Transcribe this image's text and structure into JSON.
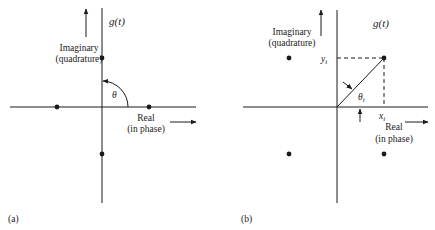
{
  "figure": {
    "panel_a": {
      "caption": "(a)",
      "title": "g(t)",
      "imaginary_label_line1": "Imaginary",
      "imaginary_label_line2": "(quadrature)",
      "real_label_line1": "Real",
      "real_label_line2": "(in phase)",
      "angle_label": "θ",
      "points": [
        {
          "name": "top",
          "x": 0,
          "y": 1
        },
        {
          "name": "left",
          "x": -1,
          "y": 0
        },
        {
          "name": "right",
          "x": 1,
          "y": 0
        },
        {
          "name": "bottom",
          "x": 0,
          "y": -1
        }
      ]
    },
    "panel_b": {
      "caption": "(b)",
      "title": "g(t)",
      "imaginary_label_line1": "Imaginary",
      "imaginary_label_line2": "(quadrature)",
      "real_label_line1": "Real",
      "real_label_line2": "(in phase)",
      "angle_label": "θ",
      "angle_subscript": "i",
      "x_label": "x",
      "x_subscript": "i",
      "y_label": "y",
      "y_subscript": "i",
      "points": [
        {
          "name": "q1",
          "x": 1,
          "y": 1
        },
        {
          "name": "q2",
          "x": -1,
          "y": 1
        },
        {
          "name": "q3",
          "x": -1,
          "y": -1
        },
        {
          "name": "q4",
          "x": 1,
          "y": -1
        }
      ]
    },
    "colors": {
      "ink": "#1a1a1a",
      "background": "#ffffff"
    }
  }
}
